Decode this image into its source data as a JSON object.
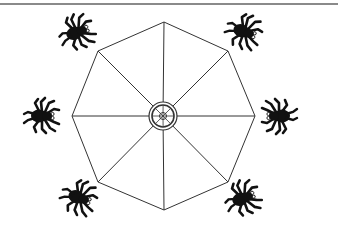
{
  "diagram": {
    "title": "",
    "web": {
      "shape": "octagon",
      "sides": 8,
      "spokes": 8,
      "hub": "double ring with cross at center"
    },
    "spiders": [
      {
        "id": "spider-top-left",
        "position": "top-left"
      },
      {
        "id": "spider-top-right",
        "position": "top-right"
      },
      {
        "id": "spider-left",
        "position": "left"
      },
      {
        "id": "spider-right",
        "position": "right"
      },
      {
        "id": "spider-bottom-left",
        "position": "bottom-left"
      },
      {
        "id": "spider-bottom-right",
        "position": "bottom-right"
      }
    ],
    "colors": {
      "line": "#333333",
      "spider": "#111111",
      "rule": "#8a8a8a",
      "background": "#ffffff"
    }
  }
}
